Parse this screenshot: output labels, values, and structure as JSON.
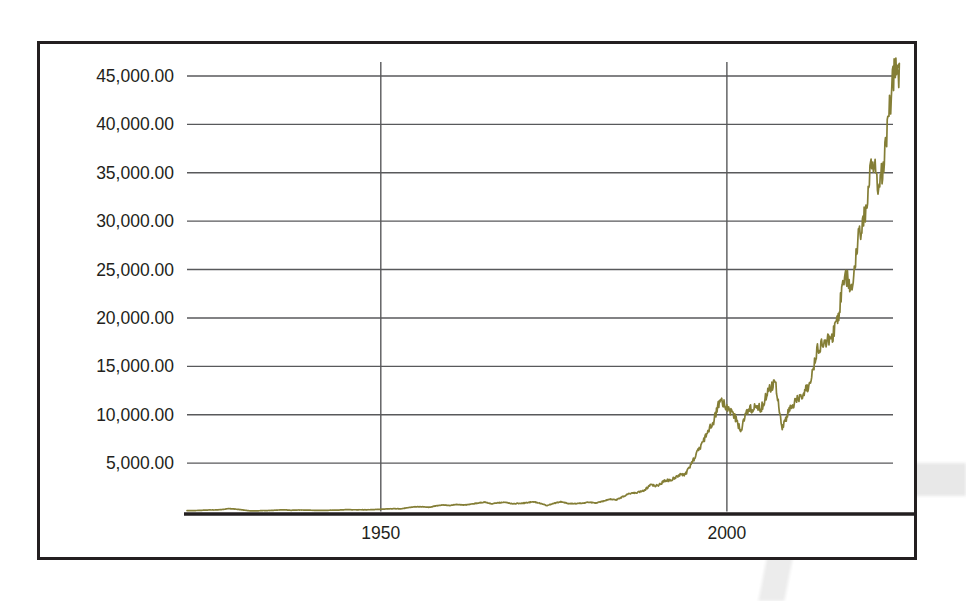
{
  "chart_data": {
    "type": "line",
    "title": "",
    "subtitle": "",
    "xlabel": "",
    "ylabel": "",
    "grid": true,
    "legend": false,
    "legend_position": "none",
    "series_color": "#847e36",
    "xlim": [
      1922,
      2024
    ],
    "ylim": [
      0,
      47500
    ],
    "ytick_labels": [
      "45,000.00",
      "40,000.00",
      "35,000.00",
      "30,000.00",
      "25,000.00",
      "20,000.00",
      "15,000.00",
      "10,000.00",
      "5,000.00"
    ],
    "ytick_values": [
      45000,
      40000,
      35000,
      30000,
      25000,
      20000,
      15000,
      10000,
      5000
    ],
    "xtick_labels": [
      "1950",
      "2000"
    ],
    "xtick_values": [
      1950,
      2000
    ],
    "series": [
      {
        "name": "Index level",
        "x": [
          1922,
          1923,
          1924,
          1925,
          1926,
          1927,
          1928,
          1929,
          1930,
          1931,
          1932,
          1933,
          1934,
          1935,
          1936,
          1937,
          1938,
          1939,
          1940,
          1941,
          1942,
          1943,
          1944,
          1945,
          1946,
          1947,
          1948,
          1949,
          1950,
          1951,
          1952,
          1953,
          1954,
          1955,
          1956,
          1957,
          1958,
          1959,
          1960,
          1961,
          1962,
          1963,
          1964,
          1965,
          1966,
          1967,
          1968,
          1969,
          1970,
          1971,
          1972,
          1973,
          1974,
          1975,
          1976,
          1977,
          1978,
          1979,
          1980,
          1981,
          1982,
          1983,
          1984,
          1985,
          1986,
          1987,
          1988,
          1989,
          1990,
          1991,
          1992,
          1993,
          1994,
          1995,
          1996,
          1997,
          1998,
          1999,
          2000,
          2001,
          2002,
          2003,
          2004,
          2005,
          2006,
          2007,
          2008,
          2009,
          2010,
          2011,
          2012,
          2013,
          2014,
          2015,
          2016,
          2017,
          2018,
          2019,
          2020,
          2021,
          2022,
          2023,
          2024
        ],
        "values": [
          98,
          95,
          120,
          156,
          157,
          202,
          300,
          248,
          165,
          77,
          60,
          99,
          104,
          144,
          180,
          121,
          155,
          150,
          131,
          111,
          119,
          136,
          152,
          193,
          177,
          181,
          177,
          200,
          235,
          269,
          292,
          281,
          404,
          488,
          499,
          436,
          584,
          679,
          616,
          731,
          652,
          763,
          874,
          969,
          786,
          905,
          944,
          800,
          839,
          890,
          1020,
          851,
          616,
          852,
          1005,
          831,
          805,
          839,
          964,
          875,
          1047,
          1259,
          1212,
          1547,
          1896,
          1939,
          2169,
          2753,
          2634,
          3169,
          3301,
          3754,
          3834,
          5117,
          6448,
          7908,
          9181,
          11497,
          10787,
          10022,
          8342,
          10454,
          10783,
          10718,
          12463,
          13265,
          8776,
          10428,
          11578,
          12218,
          13104,
          16577,
          17823,
          17425,
          19763,
          24719,
          23327,
          28538,
          30606,
          36338,
          33147,
          37690,
          45014
        ]
      }
    ],
    "annotations": []
  },
  "figure": {
    "frame_color": "#231f20",
    "background": "#ffffff",
    "gridline_color": "#58595b"
  }
}
